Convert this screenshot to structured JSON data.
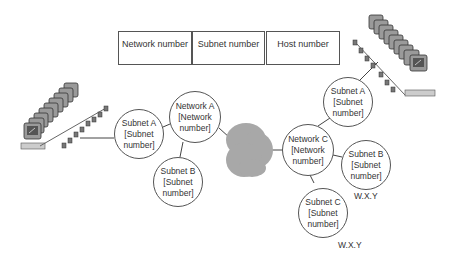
{
  "address_fields": [
    {
      "label": "Network number"
    },
    {
      "label": "Subnet number"
    },
    {
      "label": "Host number"
    }
  ],
  "left_network": {
    "router": {
      "title": "Network A",
      "line1": "[Network",
      "line2": "number]"
    },
    "subnets": [
      {
        "title": "Subnet A",
        "line1": "[Subnet",
        "line2": "number]"
      },
      {
        "title": "Subnet B",
        "line1": "[Subnet",
        "line2": "number]"
      }
    ],
    "host_group_icon": "computer-row-icon"
  },
  "cloud": {
    "icon": "internet-cloud-icon",
    "color": "#a8a8a8"
  },
  "right_network": {
    "router": {
      "title": "Network C",
      "line1": "[Network",
      "line2": "number]"
    },
    "subnets": [
      {
        "title": "Subnet A",
        "line1": "[Subnet",
        "line2": "number]"
      },
      {
        "title": "Subnet B",
        "line1": "[Subnet",
        "line2": "number]",
        "address": "W.X.Y"
      },
      {
        "title": "Subnet C",
        "line1": "[Subnet",
        "line2": "number]",
        "address": "W.X.Y"
      }
    ],
    "host_group_icon": "computer-row-icon"
  }
}
